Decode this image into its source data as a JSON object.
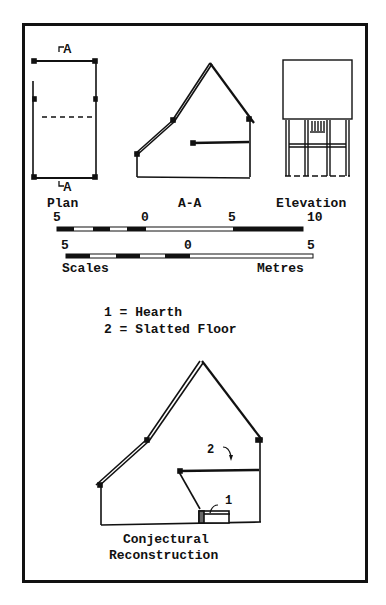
{
  "figure": {
    "views": {
      "plan": {
        "label": "Plan",
        "section_marker_top": "A",
        "section_marker_bottom": "A"
      },
      "section": {
        "label": "A-A"
      },
      "elevation": {
        "label": "Elevation"
      }
    },
    "scales": {
      "upper": {
        "ticks": [
          "5",
          "0",
          "5",
          "10"
        ]
      },
      "lower": {
        "ticks": [
          "5",
          "0",
          "5"
        ]
      },
      "left_label": "Scales",
      "right_label": "Metres"
    },
    "legend": [
      {
        "key": "1",
        "text": "1 = Hearth"
      },
      {
        "key": "2",
        "text": "2 = Slatted Floor"
      }
    ],
    "reconstruction": {
      "callout_1": "1",
      "callout_2": "2",
      "caption_line1": "Conjectural",
      "caption_line2": "Reconstruction"
    }
  }
}
